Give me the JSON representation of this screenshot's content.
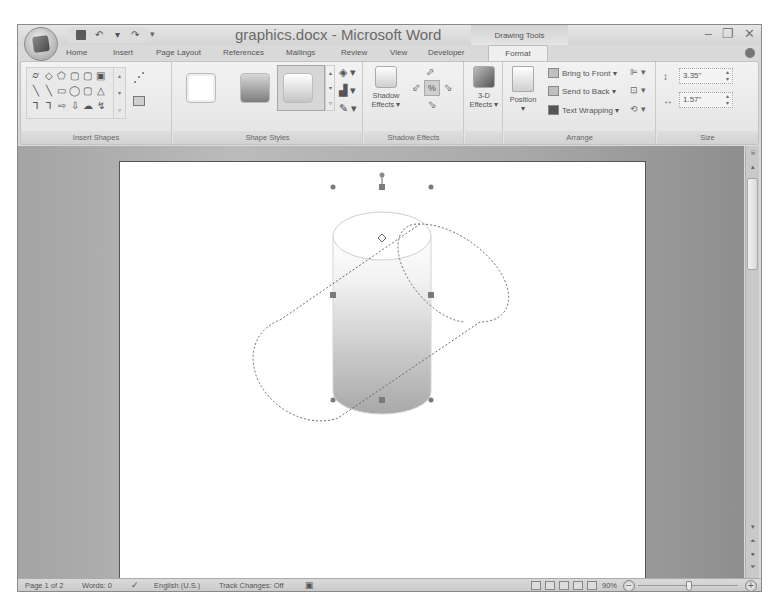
{
  "window": {
    "title": "graphics.docx - Microsoft Word",
    "context_tab_group": "Drawing Tools",
    "controls": {
      "minimize": "–",
      "restore": "❐",
      "close": "✕"
    }
  },
  "quick_access": {
    "save": "save-icon",
    "undo": "↶",
    "undo_drop": "▾",
    "redo": "↷",
    "customize": "▾"
  },
  "tabs": [
    {
      "label": "Home",
      "x": 48
    },
    {
      "label": "Insert",
      "x": 95
    },
    {
      "label": "Page Layout",
      "x": 138
    },
    {
      "label": "References",
      "x": 205
    },
    {
      "label": "Mailings",
      "x": 268
    },
    {
      "label": "Review",
      "x": 323
    },
    {
      "label": "View",
      "x": 372
    },
    {
      "label": "Developer",
      "x": 410
    },
    {
      "label": "Format",
      "x": 470,
      "active": true
    }
  ],
  "ribbon": {
    "insert_shapes": {
      "label": "Insert Shapes",
      "shapes": [
        "⌭",
        "◇",
        "⬠",
        "▢",
        "▢",
        "▣",
        "╲",
        "╲",
        "▭",
        "◯",
        "▢",
        "△",
        "⅂",
        "⅂",
        "⇨",
        "⇩",
        "☁",
        "↯"
      ],
      "scroll": [
        "▴",
        "▾",
        "▿"
      ],
      "edit_shape": "⋰"
    },
    "shape_styles": {
      "label": "Shape Styles",
      "scroll": [
        "▴",
        "▾",
        "▿"
      ],
      "commands": [
        "◈ ▾",
        "▟ ▾",
        "✎ ▾"
      ]
    },
    "shadow_effects": {
      "label": "Shadow Effects",
      "button_line1": "Shadow",
      "button_line2": "Effects ▾",
      "nudge_up": "⬀",
      "nudge_left": "⬃",
      "nudge_toggle": "%",
      "nudge_right": "⬂",
      "nudge_down": "⬂"
    },
    "three_d": {
      "line1": "3-D",
      "line2": "Effects ▾"
    },
    "arrange": {
      "label": "Arrange",
      "position_label": "Position",
      "position_drop": "▾",
      "bring_to_front": "Bring to Front ▾",
      "send_to_back": "Send to Back ▾",
      "text_wrapping": "Text Wrapping ▾",
      "align": "⊫ ▾",
      "group": "⊡ ▾",
      "rotate": "⟲ ▾"
    },
    "size": {
      "label": "Size",
      "height": "3.35\"",
      "width": "1.57\"",
      "spin": "▴\n▾"
    }
  },
  "scrollbar": {
    "up": "▴",
    "down": "▾",
    "prev_page": "⏶",
    "browse": "●",
    "next_page": "⏷",
    "ruler_toggle": "⌸"
  },
  "status_bar": {
    "page": "Page 1 of 2",
    "words": "Words: 0",
    "proofing_icon": "✓",
    "language": "English (U.S.)",
    "track_changes": "Track Changes: Off",
    "macro_icon": "▣",
    "zoom_level": "90%",
    "zoom_out": "−",
    "zoom_in": "+"
  }
}
